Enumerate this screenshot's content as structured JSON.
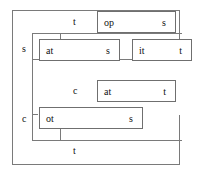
{
  "diagram": {
    "canvas": {
      "width": 204,
      "height": 175,
      "background": "#ffffff"
    },
    "stroke_color": "#7a7a7a",
    "text_color": "#111111",
    "outer_labels": [
      {
        "name": "outer-label-s",
        "text": "s"
      },
      {
        "name": "outer-label-c",
        "text": "c"
      }
    ],
    "bracket_labels": [
      {
        "name": "bracket-label-t-top",
        "text": "t"
      },
      {
        "name": "bracket-label-c-mid",
        "text": "c"
      },
      {
        "name": "bracket-label-t-bottom",
        "text": "t"
      }
    ],
    "boxes": [
      {
        "name": "box-op-s",
        "left": "op",
        "right": "s"
      },
      {
        "name": "box-at-s",
        "left": "at",
        "right": "s"
      },
      {
        "name": "box-it-t",
        "left": "it",
        "right": "t"
      },
      {
        "name": "box-at-t",
        "left": "at",
        "right": "t"
      },
      {
        "name": "box-ot-s",
        "left": "ot",
        "right": "s"
      }
    ]
  }
}
